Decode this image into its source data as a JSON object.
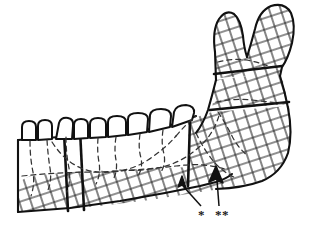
{
  "figure": {
    "background_color": "#ffffff",
    "line_color": "#111111",
    "hatch_color": "#222222",
    "dashed_color": "#333333",
    "width": 311,
    "height": 236
  },
  "labels": [
    {
      "name": "single-asterisk",
      "text": "*",
      "x": 198,
      "y": 208
    },
    {
      "name": "double-asterisk",
      "text": "**",
      "x": 215,
      "y": 208
    }
  ],
  "annotations": {
    "arrows": [
      {
        "name": "arrow-single-asterisk",
        "points_to": "inferior border of mandibular body",
        "tip_x": 182,
        "tip_y": 178,
        "leader_from_x": 201,
        "leader_from_y": 205
      },
      {
        "name": "arrow-double-asterisk",
        "points_to": "inferior border posterior segment",
        "tip_x": 216,
        "tip_y": 168,
        "leader_from_x": 219,
        "leader_from_y": 205
      }
    ]
  },
  "anatomy": {
    "parts": [
      "condyle",
      "coronoid-process",
      "sigmoid-notch",
      "ramus",
      "gonial-angle",
      "mandibular-body",
      "teeth-arch",
      "mandibular-canal"
    ],
    "tooth_count": 8,
    "osteotomy_cuts": [
      "vertical-anterior-cut",
      "vertical-posterior-cut",
      "horizontal-upper-ramus-cut",
      "horizontal-lower-ramus-cut"
    ]
  }
}
